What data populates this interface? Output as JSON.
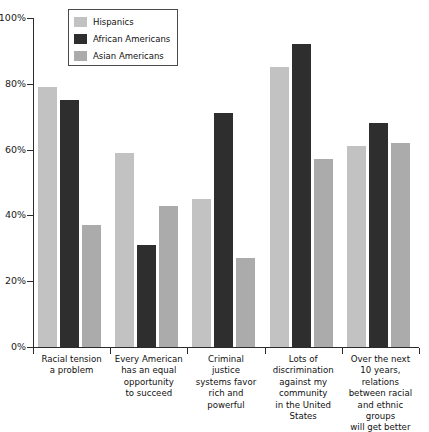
{
  "chart_data": {
    "type": "bar",
    "title": "",
    "subtitle": "",
    "xlabel": "",
    "ylabel": "",
    "ylim": [
      0,
      100
    ],
    "y_ticks": [
      "0%",
      "20%",
      "40%",
      "60%",
      "80%",
      "100%"
    ],
    "y_tick_values": [
      0,
      20,
      40,
      60,
      80,
      100
    ],
    "grid": false,
    "legend_position": "top-left-inside",
    "value_unit": "%",
    "categories": [
      "Racial tension\na problem",
      "Every American\nhas an equal\nopportunity\nto succeed",
      "Criminal\njustice\nsystems favor\nrich and\npowerful",
      "Lots of\ndiscrimination\nagainst my\ncommunity\nin the United\nStates",
      "Over the next\n10 years,\nrelations\nbetween racial\nand ethnic\ngroups\nwill get better"
    ],
    "category_lines": [
      [
        "Racial tension",
        "a problem"
      ],
      [
        "Every American",
        "has an equal",
        "opportunity",
        "to succeed"
      ],
      [
        "Criminal",
        "justice",
        "systems favor",
        "rich and",
        "powerful"
      ],
      [
        "Lots of",
        "discrimination",
        "against my",
        "community",
        "in the United",
        "States"
      ],
      [
        "Over the next",
        "10 years,",
        "relations",
        "between racial",
        "and ethnic",
        "groups",
        "will get better"
      ]
    ],
    "series": [
      {
        "name": "Hispanics",
        "color": "#c2c2c2",
        "values": [
          79,
          59,
          45,
          85,
          61
        ]
      },
      {
        "name": "African Americans",
        "color": "#2e2e2e",
        "values": [
          75,
          31,
          71,
          92,
          68
        ]
      },
      {
        "name": "Asian Americans",
        "color": "#ababab",
        "values": [
          37,
          43,
          27,
          57,
          62
        ]
      }
    ]
  },
  "legend": {
    "items": [
      {
        "label": "Hispanics"
      },
      {
        "label": "African Americans"
      },
      {
        "label": "Asian Americans"
      }
    ]
  }
}
